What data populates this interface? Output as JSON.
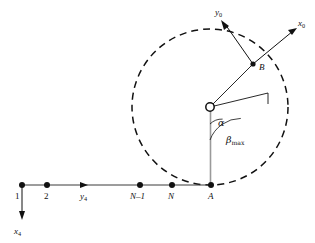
{
  "figure": {
    "background_color": "#ffffff",
    "stroke_color": "#111111",
    "gray_stroke_color": "#999999"
  },
  "chain": {
    "nodes": [
      {
        "id": "node-1",
        "label": "1",
        "label_style": "upright",
        "x": 22,
        "y": 185
      },
      {
        "id": "node-2",
        "label": "2",
        "label_style": "upright",
        "x": 47,
        "y": 185
      },
      {
        "id": "node-n-minus-1",
        "label": "N–1",
        "label_style": "italic",
        "x": 140,
        "y": 185
      },
      {
        "id": "node-n",
        "label": "N",
        "label_style": "italic",
        "x": 172,
        "y": 185
      },
      {
        "id": "node-a",
        "label": "A",
        "label_style": "italic",
        "x": 211,
        "y": 185
      }
    ],
    "baseline_label_y": 197,
    "axis_y4": {
      "label": "y",
      "subscript": "4",
      "arrow_tip_x": 88,
      "label_x": 82,
      "label_y": 197
    },
    "axis_x4": {
      "label": "x",
      "subscript": "4",
      "arrow_tip_y": 218,
      "label_x": 17,
      "label_y": 233
    }
  },
  "circle": {
    "center_x": 210,
    "center_y": 107,
    "radius": 78,
    "dashed": true,
    "center_marker": "open-circle"
  },
  "point_b": {
    "label": "B",
    "x": 253,
    "y": 64,
    "label_x": 259,
    "label_y": 70
  },
  "frame_0": {
    "x_axis": {
      "label": "x",
      "subscript": "0",
      "tip_x": 297,
      "tip_y": 28,
      "label_x": 299,
      "label_y": 25
    },
    "y_axis": {
      "label": "y",
      "subscript": "0",
      "tip_x": 221,
      "tip_y": 20,
      "label_x": 218,
      "label_y": 14
    }
  },
  "angles": {
    "alpha": {
      "symbol": "α",
      "label_x": 221,
      "label_y": 124,
      "arc_radius": 17
    },
    "beta_max": {
      "symbol": "β",
      "subscript": "max",
      "label_x": 228,
      "label_y": 141,
      "arc_radius": 33
    }
  },
  "beta_ray": {
    "end_x": 268,
    "end_y": 93
  }
}
